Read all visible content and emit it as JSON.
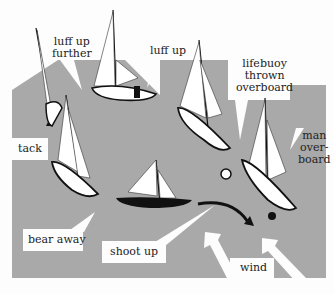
{
  "figure": {
    "background_color": "#a9a9a9",
    "paper_color": "#fdfdfd",
    "labels": {
      "luff_up_further": [
        "luff up",
        "further"
      ],
      "luff_up": "luff up",
      "lifebuoy": [
        "lifebuoy",
        "thrown",
        "overboard"
      ],
      "man_overboard": [
        "man",
        "over-",
        "board"
      ],
      "tack": "tack",
      "bear_away": "bear away",
      "shoot_up": "shoot up",
      "wind": "wind"
    }
  }
}
